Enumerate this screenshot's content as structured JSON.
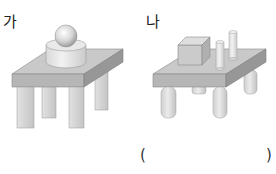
{
  "figures": [
    {
      "label": "가",
      "description": "Table with square legs holding a cylinder with a sphere on top",
      "objects": [
        "cylinder",
        "sphere"
      ],
      "leg_shape": "square-prism"
    },
    {
      "label": "나",
      "description": "Table with round legs holding a cube and two cylinders",
      "objects": [
        "cube",
        "cylinder",
        "cylinder"
      ],
      "leg_shape": "cylinder"
    }
  ],
  "answer_box": {
    "open": "(",
    "close": ")",
    "value": ""
  },
  "colors": {
    "top_face": "#c9c9c9",
    "front_face": "#b4b4b4",
    "side_face": "#9a9a9a",
    "leg_light": "#dcdcdc",
    "leg_dark": "#bdbdbd",
    "object_light": "#e6e6e6"
  }
}
